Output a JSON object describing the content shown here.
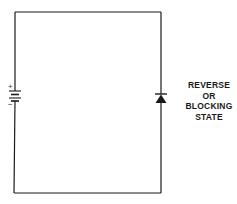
{
  "diagram": {
    "type": "circuit",
    "components": [
      {
        "id": "battery",
        "kind": "dc-source",
        "position": "left-branch",
        "polarity": {
          "top": "+",
          "bottom": "-"
        }
      },
      {
        "id": "diode",
        "kind": "diode",
        "position": "right-branch",
        "orientation": "anode-bottom-cathode-top",
        "bias": "reverse"
      }
    ],
    "wiring": "single series loop connecting battery and diode"
  },
  "battery": {
    "plus_label": "+",
    "minus_label": "−"
  },
  "caption": {
    "lines": [
      "REVERSE",
      "OR",
      "BLOCKING",
      "STATE"
    ]
  },
  "colors": {
    "wire": "#1a1a1a",
    "background": "#ffffff",
    "text": "#1a1a1a"
  }
}
